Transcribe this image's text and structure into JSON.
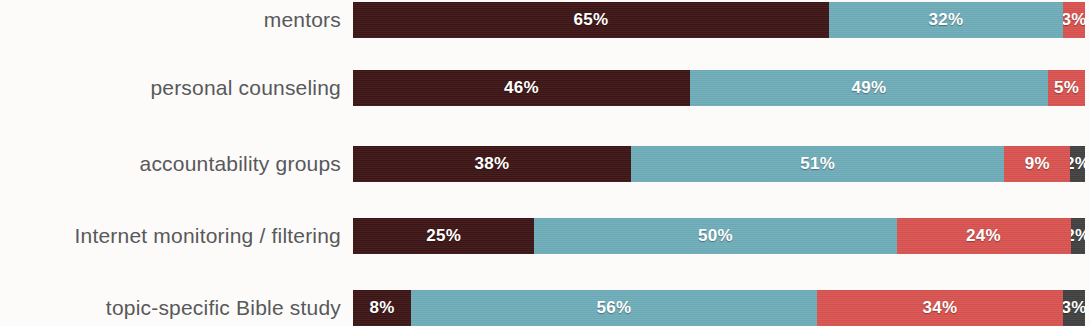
{
  "chart_data": {
    "type": "bar",
    "subtype": "stacked-horizontal-100",
    "title": "",
    "subtitle": "",
    "xlabel": "",
    "ylabel": "",
    "xlim": [
      0,
      100
    ],
    "grid": false,
    "legend": "none",
    "value_suffix": "%",
    "categories": [
      "mentors",
      "personal counseling",
      "accountability groups",
      "Internet monitoring / filtering",
      "topic-specific Bible study"
    ],
    "series": [
      {
        "name": "segment-1",
        "color": "#3d1515",
        "values": [
          65,
          46,
          38,
          25,
          8
        ]
      },
      {
        "name": "segment-2",
        "color": "#6fadba",
        "values": [
          32,
          49,
          51,
          50,
          56
        ]
      },
      {
        "name": "segment-3",
        "color": "#d9534f",
        "values": [
          3,
          5,
          9,
          24,
          34
        ]
      },
      {
        "name": "segment-4",
        "color": "#414141",
        "values": [
          0,
          0,
          2,
          2,
          3
        ]
      }
    ],
    "rows": [
      {
        "label": "mentors",
        "segments": [
          {
            "value": 65,
            "label": "65%",
            "color": "#3d1515"
          },
          {
            "value": 32,
            "label": "32%",
            "color": "#6fadba"
          },
          {
            "value": 3,
            "label": "3%",
            "color": "#d9534f"
          }
        ]
      },
      {
        "label": "personal counseling",
        "segments": [
          {
            "value": 46,
            "label": "46%",
            "color": "#3d1515"
          },
          {
            "value": 49,
            "label": "49%",
            "color": "#6fadba"
          },
          {
            "value": 5,
            "label": "5%",
            "color": "#d9534f"
          }
        ]
      },
      {
        "label": "accountability groups",
        "segments": [
          {
            "value": 38,
            "label": "38%",
            "color": "#3d1515"
          },
          {
            "value": 51,
            "label": "51%",
            "color": "#6fadba"
          },
          {
            "value": 9,
            "label": "9%",
            "color": "#d9534f"
          },
          {
            "value": 2,
            "label": "2%",
            "color": "#414141"
          }
        ]
      },
      {
        "label": "Internet monitoring / filtering",
        "segments": [
          {
            "value": 25,
            "label": "25%",
            "color": "#3d1515"
          },
          {
            "value": 50,
            "label": "50%",
            "color": "#6fadba"
          },
          {
            "value": 24,
            "label": "24%",
            "color": "#d9534f"
          },
          {
            "value": 2,
            "label": "2%",
            "color": "#414141"
          }
        ]
      },
      {
        "label": "topic-specific Bible study",
        "segments": [
          {
            "value": 8,
            "label": "8%",
            "color": "#3d1515"
          },
          {
            "value": 56,
            "label": "56%",
            "color": "#6fadba"
          },
          {
            "value": 34,
            "label": "34%",
            "color": "#d9534f"
          },
          {
            "value": 3,
            "label": "3%",
            "color": "#414141"
          }
        ]
      }
    ]
  },
  "layout": {
    "background_color": "#fcfbf9",
    "label_color": "#58595b",
    "value_color": "#ffffff",
    "row_tops": [
      2,
      70,
      146,
      218,
      290
    ],
    "bar_height": 36,
    "bar_left": 353,
    "bar_width": 732
  }
}
